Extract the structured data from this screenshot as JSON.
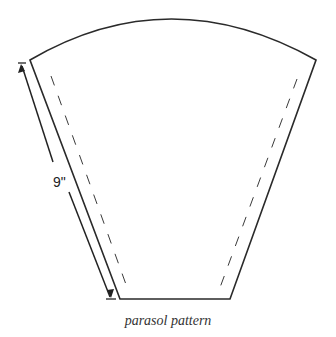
{
  "figure": {
    "caption": "parasol pattern",
    "dimension_label": "9\"",
    "colors": {
      "line": "#2a2a2a",
      "background": "#ffffff"
    }
  },
  "shape": {
    "top_left": [
      30,
      60
    ],
    "top_right": [
      316,
      60
    ],
    "bottom_right": [
      230,
      299
    ],
    "bottom_left": [
      120,
      299
    ],
    "arc_apex_y": 18
  }
}
